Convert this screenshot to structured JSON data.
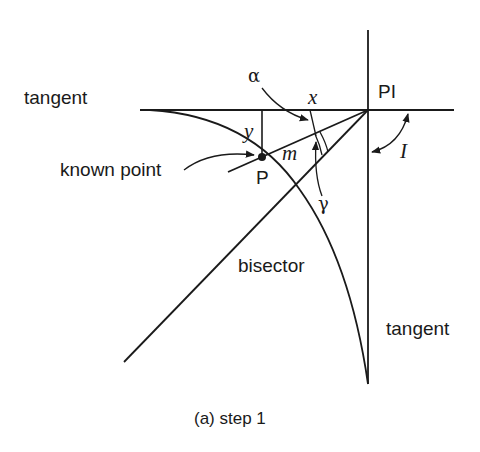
{
  "diagram": {
    "caption": "(a) step 1",
    "labels": {
      "tangent_top": "tangent",
      "tangent_right": "tangent",
      "known_point": "known point",
      "pi": "PI",
      "p": "P",
      "x": "x",
      "y": "y",
      "m": "m",
      "alpha": "α",
      "gamma": "γ",
      "intersection_angle": "I",
      "bisector": "bisector"
    },
    "colors": {
      "stroke": "#1a1a1a",
      "background": "#ffffff"
    },
    "geometry": {
      "pi_point": [
        368,
        110
      ],
      "known_point_p": [
        262,
        157
      ],
      "back_tangent": {
        "from": [
          140,
          110
        ],
        "to": [
          454,
          110
        ]
      },
      "forward_tangent": {
        "from": [
          368,
          30
        ],
        "to": [
          368,
          384
        ]
      },
      "bisector": {
        "from": [
          368,
          110
        ],
        "to": [
          124,
          362
        ]
      },
      "line_m": {
        "from": [
          368,
          110
        ],
        "to": [
          228,
          172
        ]
      }
    }
  }
}
